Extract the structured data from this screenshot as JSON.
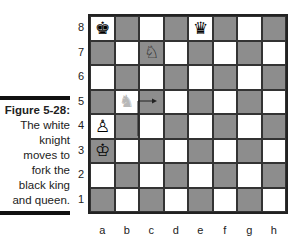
{
  "caption": {
    "title": "Figure 5-28:",
    "lines": [
      "The white",
      "knight",
      "moves to",
      "fork the",
      "black king",
      "and queen."
    ]
  },
  "board": {
    "ranks": [
      "8",
      "7",
      "6",
      "5",
      "4",
      "3",
      "2",
      "1"
    ],
    "files": [
      "a",
      "b",
      "c",
      "d",
      "e",
      "f",
      "g",
      "h"
    ],
    "pieces": [
      {
        "square": "a8",
        "piece": "black-king",
        "glyph": "♚"
      },
      {
        "square": "e8",
        "piece": "black-queen",
        "glyph": "♛"
      },
      {
        "square": "c7",
        "piece": "white-knight",
        "glyph": "♘"
      },
      {
        "square": "b5",
        "piece": "white-knight-ghost",
        "glyph": "♞"
      },
      {
        "square": "a4",
        "piece": "white-pawn",
        "glyph": "♙"
      },
      {
        "square": "a3",
        "piece": "white-king",
        "glyph": "♔"
      }
    ],
    "move": {
      "from": "b5",
      "to": "c7"
    },
    "colors": {
      "light": "#ffffff",
      "dark": "#8d8d8d"
    }
  }
}
